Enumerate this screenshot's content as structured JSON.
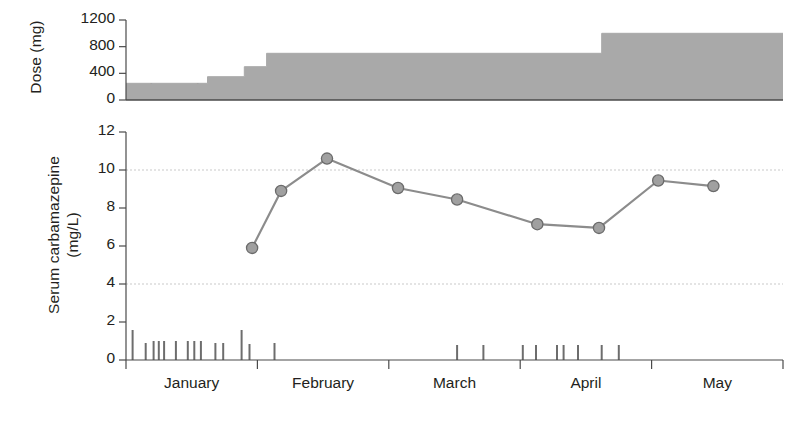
{
  "figure": {
    "background": "#ffffff",
    "ink": "#231f20",
    "band_fill": "#a9a9a9",
    "band_stroke": "#6f6f6f",
    "line_color": "#8c8c8c",
    "marker_fill": "#a0a0a0",
    "marker_stroke": "#6b6b6b",
    "gridline_color": "#c9c9c9",
    "event_tick_color": "#6d6d6d"
  },
  "chart_data": [
    {
      "type": "area",
      "panel": "dose",
      "title": "",
      "xlabel": "",
      "ylabel": "Dose (mg)",
      "ylim": [
        0,
        1200
      ],
      "yticks": [
        0,
        400,
        800,
        1200
      ],
      "ytick_labels": [
        "0",
        "400",
        "800",
        "1200"
      ],
      "grid": false,
      "x_categories": [
        "January",
        "February",
        "March",
        "April",
        "May"
      ],
      "annotations": [
        "Phenytoin",
        "Carbamazepine"
      ],
      "steps": [
        {
          "drug": "Phenytoin",
          "start_month": "January",
          "start_frac": 0.0,
          "end_month": "January",
          "end_frac": 0.62,
          "dose": 250
        },
        {
          "drug": "Carbamazepine",
          "start_month": "January",
          "start_frac": 0.62,
          "end_month": "January",
          "end_frac": 0.9,
          "dose": 350
        },
        {
          "drug": "Carbamazepine",
          "start_month": "January",
          "start_frac": 0.9,
          "end_month": "February",
          "end_frac": 0.07,
          "dose": 500
        },
        {
          "drug": "Carbamazepine",
          "start_month": "February",
          "start_frac": 0.07,
          "end_month": "April",
          "end_frac": 0.62,
          "dose": 700
        },
        {
          "drug": "Carbamazepine",
          "start_month": "April",
          "start_frac": 0.62,
          "end_month": "May",
          "end_frac": 1.0,
          "dose": 1000
        }
      ]
    },
    {
      "type": "line",
      "panel": "serum",
      "title": "",
      "xlabel": "",
      "ylabel": "Serum carbamazepine\n(mg/L)",
      "ylim": [
        0,
        12
      ],
      "yticks": [
        0,
        2,
        4,
        6,
        8,
        10,
        12
      ],
      "ytick_labels": [
        "0",
        "2",
        "4",
        "6",
        "8",
        "10",
        "12"
      ],
      "grid": false,
      "reference_lines": [
        4,
        10
      ],
      "reference_line_style": "dotted",
      "x_categories": [
        "January",
        "February",
        "March",
        "April",
        "May"
      ],
      "series": [
        {
          "name": "Serum carbamazepine",
          "points": [
            {
              "month": "January",
              "frac": 0.96,
              "value": 5.9
            },
            {
              "month": "February",
              "frac": 0.18,
              "value": 8.9
            },
            {
              "month": "February",
              "frac": 0.53,
              "value": 10.6
            },
            {
              "month": "March",
              "frac": 0.07,
              "value": 9.05
            },
            {
              "month": "March",
              "frac": 0.52,
              "value": 8.45
            },
            {
              "month": "April",
              "frac": 0.13,
              "value": 7.15
            },
            {
              "month": "April",
              "frac": 0.6,
              "value": 6.95
            },
            {
              "month": "May",
              "frac": 0.05,
              "value": 9.45
            },
            {
              "month": "May",
              "frac": 0.47,
              "value": 9.15
            }
          ]
        }
      ]
    },
    {
      "type": "bar",
      "panel": "events",
      "title": "",
      "xlabel": "",
      "ylabel": "",
      "grid": false,
      "description": "Seizure event tick marks along the time axis; bar height indicates event magnitude",
      "x_categories": [
        "January",
        "February",
        "March",
        "April",
        "May"
      ],
      "events": [
        {
          "month": "January",
          "frac": 0.05,
          "height": 30
        },
        {
          "month": "January",
          "frac": 0.15,
          "height": 17
        },
        {
          "month": "January",
          "frac": 0.21,
          "height": 19
        },
        {
          "month": "January",
          "frac": 0.25,
          "height": 19
        },
        {
          "month": "January",
          "frac": 0.29,
          "height": 19
        },
        {
          "month": "January",
          "frac": 0.38,
          "height": 19
        },
        {
          "month": "January",
          "frac": 0.47,
          "height": 19
        },
        {
          "month": "January",
          "frac": 0.52,
          "height": 19
        },
        {
          "month": "January",
          "frac": 0.57,
          "height": 19
        },
        {
          "month": "January",
          "frac": 0.68,
          "height": 17
        },
        {
          "month": "January",
          "frac": 0.74,
          "height": 17
        },
        {
          "month": "January",
          "frac": 0.88,
          "height": 30
        },
        {
          "month": "January",
          "frac": 0.94,
          "height": 16
        },
        {
          "month": "February",
          "frac": 0.13,
          "height": 17
        },
        {
          "month": "March",
          "frac": 0.52,
          "height": 15
        },
        {
          "month": "March",
          "frac": 0.72,
          "height": 15
        },
        {
          "month": "April",
          "frac": 0.02,
          "height": 15
        },
        {
          "month": "April",
          "frac": 0.12,
          "height": 15
        },
        {
          "month": "April",
          "frac": 0.28,
          "height": 15
        },
        {
          "month": "April",
          "frac": 0.33,
          "height": 15
        },
        {
          "month": "April",
          "frac": 0.44,
          "height": 15
        },
        {
          "month": "April",
          "frac": 0.62,
          "height": 15
        },
        {
          "month": "April",
          "frac": 0.75,
          "height": 15
        }
      ]
    }
  ],
  "dose_panel": {
    "axis_title": "Dose (mg)",
    "tick_labels": [
      "1200",
      "800",
      "400",
      "0"
    ],
    "band_labels": [
      {
        "text": "Phenytoin",
        "month": "January",
        "frac": 0.1
      },
      {
        "text": "Carbamazepine",
        "month": "February",
        "frac": 0.52
      }
    ]
  },
  "serum_panel": {
    "axis_title_line1": "Serum carbamazepine",
    "axis_title_line2": "(mg/L)",
    "tick_labels": [
      "12",
      "10",
      "8",
      "6",
      "4",
      "2",
      "0"
    ]
  },
  "x_axis": {
    "months": [
      "January",
      "February",
      "March",
      "April",
      "May"
    ]
  }
}
